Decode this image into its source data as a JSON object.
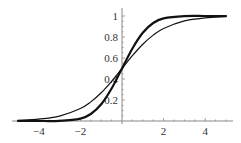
{
  "chart_data": {
    "type": "line",
    "title": "",
    "xlabel": "",
    "ylabel": "",
    "xlim": [
      -5,
      5
    ],
    "ylim": [
      0,
      1
    ],
    "grid": false,
    "legend": null,
    "x_ticks": [
      -4,
      -2,
      2,
      4
    ],
    "x_tick_labels": [
      "−4",
      "−2",
      "2",
      "4"
    ],
    "y_ticks": [
      0.2,
      0.4,
      0.6,
      0.8,
      1
    ],
    "y_tick_labels": [
      "0.2",
      "0.4",
      "0.6",
      "0.8",
      "1"
    ],
    "x": [
      -5,
      -4,
      -3,
      -2,
      -1.5,
      -1,
      -0.5,
      0,
      0.5,
      1,
      1.5,
      2,
      3,
      4,
      5
    ],
    "series": [
      {
        "name": "steep sigmoid (thick)",
        "style": "thick",
        "values": [
          0.0,
          0.0,
          0.002,
          0.023,
          0.067,
          0.159,
          0.309,
          0.5,
          0.691,
          0.841,
          0.933,
          0.977,
          0.999,
          1.0,
          1.0
        ]
      },
      {
        "name": "logistic sigmoid (thin)",
        "style": "thin",
        "values": [
          0.007,
          0.018,
          0.047,
          0.119,
          0.182,
          0.269,
          0.378,
          0.5,
          0.622,
          0.731,
          0.818,
          0.881,
          0.953,
          0.982,
          0.993
        ]
      }
    ]
  },
  "colors": {
    "axis": "#888888",
    "curve": "#111111",
    "label": "#333333"
  }
}
